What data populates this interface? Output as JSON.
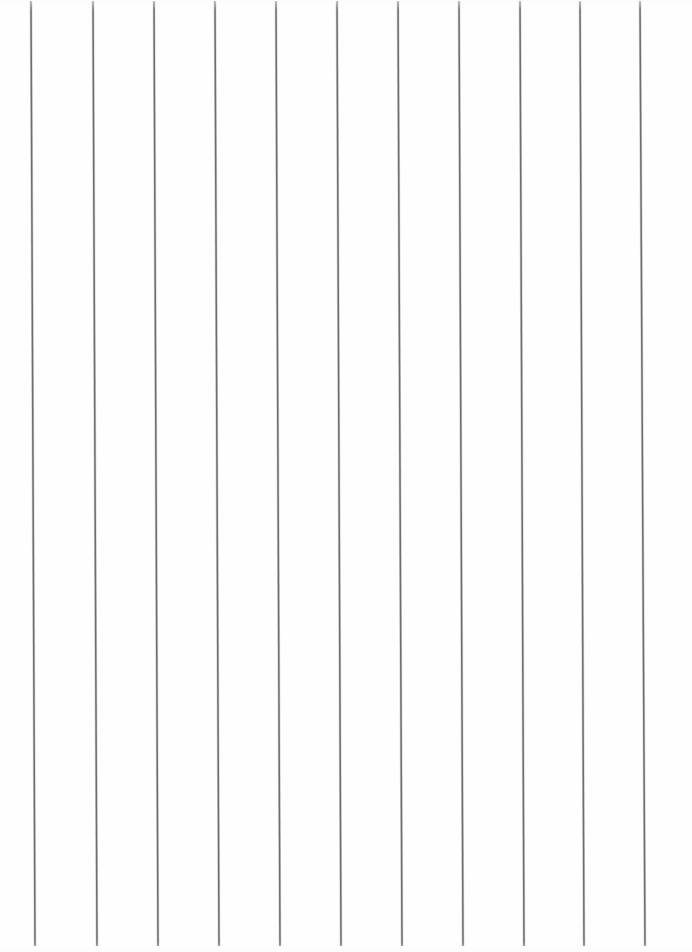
{
  "document": {
    "kind": "scanned-ruled-paper",
    "page_label": "",
    "width_px": 692,
    "height_px": 952,
    "background_color": "#ffffff",
    "paper_color": "#fefefe",
    "content_text": "",
    "has_handwriting": false,
    "has_printed_text": false
  },
  "ruling": {
    "orientation": "vertical",
    "line_count": 11,
    "line_color": "#6e6e6e",
    "line_halo_color": "#b9b9b9",
    "line_width_px": 1.5,
    "spacing_px": 61,
    "top_y_px": 1,
    "bottom_y_px": 946,
    "skew_px": 4,
    "skew_note": "lines lean slightly right from top to bottom",
    "top_x_positions": [
      31,
      93,
      154,
      215,
      276,
      337,
      398,
      459,
      520,
      580,
      640
    ],
    "bottom_x_positions": [
      35,
      97,
      158,
      219,
      280,
      341,
      402,
      463,
      524,
      584,
      645
    ]
  },
  "margins": {
    "left_px": 31,
    "right_px": 52,
    "top_px": 1,
    "bottom_px": 6
  }
}
